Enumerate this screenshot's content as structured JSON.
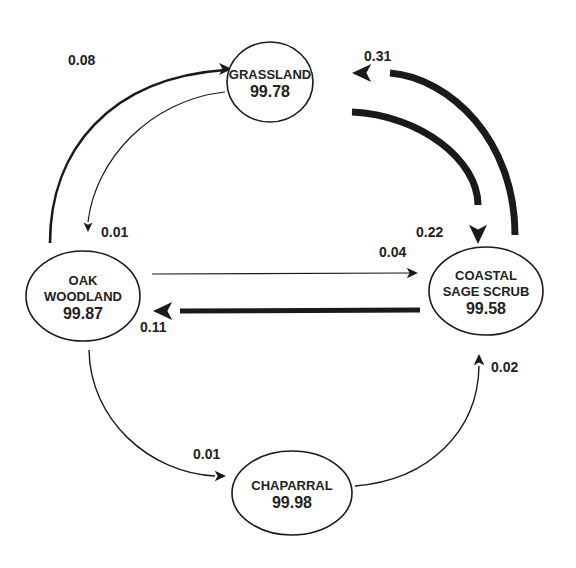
{
  "diagram": {
    "type": "state-transition",
    "nodes": [
      {
        "id": "grassland",
        "lines": [
          "GRASSLAND"
        ],
        "value": "99.78",
        "cx": 270,
        "cy": 82,
        "rx": 43,
        "ry": 40
      },
      {
        "id": "oak-woodland",
        "lines": [
          "OAK",
          "WOODLAND"
        ],
        "value": "99.87",
        "cx": 83,
        "cy": 296,
        "rx": 57,
        "ry": 45
      },
      {
        "id": "coastal-sage-scrub",
        "lines": [
          "COASTAL",
          "SAGE SCRUB"
        ],
        "value": "99.58",
        "cx": 486,
        "cy": 291,
        "rx": 57,
        "ry": 44
      },
      {
        "id": "chaparral",
        "lines": [
          "CHAPARRAL"
        ],
        "value": "99.98",
        "cx": 292,
        "cy": 493,
        "rx": 60,
        "ry": 42
      }
    ],
    "edges": [
      {
        "id": "oak-to-grassland",
        "from": "oak-woodland",
        "to": "grassland",
        "value": "0.08",
        "width": 2.6,
        "head": 8,
        "d": "M 50 243 C 50 150, 110 78, 225 70",
        "tip": [
          232,
          69
        ],
        "dir": [
          1,
          0
        ],
        "label_x": 68,
        "label_y": 65
      },
      {
        "id": "grassland-to-oak",
        "from": "grassland",
        "to": "oak-woodland",
        "value": "0.01",
        "width": 1.2,
        "head": 6,
        "d": "M 225 92 C 150 100, 95 160, 88 222",
        "tip": [
          88,
          232
        ],
        "dir": [
          0,
          1
        ],
        "label_x": 101,
        "label_y": 237
      },
      {
        "id": "coastal-to-grassland",
        "from": "coastal-sage-scrub",
        "to": "grassland",
        "value": "0.31",
        "width": 7,
        "head": 12,
        "d": "M 515 235 C 515 140, 450 78, 390 73",
        "tip": [
          352,
          73
        ],
        "dir": [
          -1,
          0
        ],
        "label_x": 364,
        "label_y": 61
      },
      {
        "id": "grassland-to-coastal",
        "from": "grassland",
        "to": "coastal-sage-scrub",
        "value": "0.22",
        "width": 7,
        "head": 12,
        "d": "M 352 112 C 420 115, 478 160, 478 205",
        "tip": [
          478,
          244
        ],
        "dir": [
          0,
          1
        ],
        "label_x": 416,
        "label_y": 237
      },
      {
        "id": "oak-to-coastal",
        "from": "oak-woodland",
        "to": "coastal-sage-scrub",
        "value": "0.04",
        "width": 1.2,
        "head": 7,
        "d": "M 152 274 L 410 273",
        "tip": [
          418,
          273
        ],
        "dir": [
          1,
          0
        ],
        "label_x": 379,
        "label_y": 257
      },
      {
        "id": "coastal-to-oak",
        "from": "coastal-sage-scrub",
        "to": "oak-woodland",
        "value": "0.11",
        "width": 5,
        "head": 12,
        "d": "M 420 310 L 180 311",
        "tip": [
          153,
          311
        ],
        "dir": [
          -1,
          0
        ],
        "label_x": 140,
        "label_y": 332
      },
      {
        "id": "oak-to-chaparral",
        "from": "oak-woodland",
        "to": "chaparral",
        "value": "0.01",
        "width": 1.4,
        "head": 7,
        "d": "M 89 350 C 90 420, 150 473, 215 476",
        "tip": [
          226,
          476
        ],
        "dir": [
          1,
          0
        ],
        "label_x": 193,
        "label_y": 459
      },
      {
        "id": "chaparral-to-coastal",
        "from": "chaparral",
        "to": "coastal-sage-scrub",
        "value": "0.02",
        "width": 1.4,
        "head": 7,
        "d": "M 355 486 C 430 480, 478 430, 479 366",
        "tip": [
          479,
          354
        ],
        "dir": [
          0,
          -1
        ],
        "label_x": 491,
        "label_y": 372
      }
    ]
  }
}
